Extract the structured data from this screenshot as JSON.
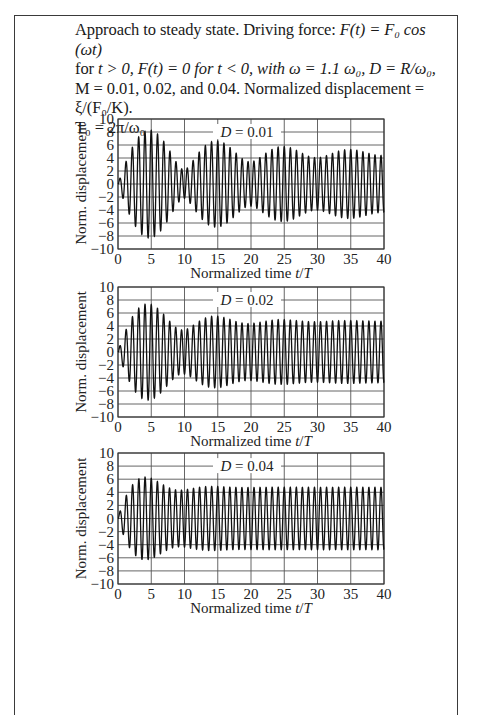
{
  "caption": {
    "line1_a": "Approach to steady state. Driving force: ",
    "line1_eq": "F(t) = F₀ cos (ωt)",
    "line2_a": "for ",
    "line2_eq": "t > 0, F(t) = 0 for t < 0, with ω = 1.1 ω₀, D = R/ω₀,",
    "line3": "M = 0.01, 0.02, and 0.04. Normalized displacement = ξ/(F₀/K).",
    "line4": "T₀ = 2π/ω₀"
  },
  "chart_data": [
    {
      "type": "line",
      "title": "D = 0.01",
      "xlabel": "Normalized time t/T",
      "ylabel": "Norm. displacement",
      "xlim": [
        0,
        40
      ],
      "ylim": [
        -10,
        10
      ],
      "xticks": [
        0,
        5,
        10,
        15,
        20,
        25,
        30,
        35,
        40
      ],
      "yticks": [
        -10,
        -8,
        -6,
        -4,
        -2,
        0,
        2,
        4,
        6,
        8,
        10
      ],
      "grid": true,
      "model": {
        "omega_ratio": 1.1,
        "damping": 0.01
      },
      "envelope_peaks": [
        {
          "t": 5,
          "y": -9.8
        },
        {
          "t": 10,
          "y": 2.0
        },
        {
          "t": 15,
          "y": 8.0
        },
        {
          "t": 20,
          "y": 2.5
        },
        {
          "t": 25,
          "y": -8.0
        },
        {
          "t": 30,
          "y": 3.0
        },
        {
          "t": 35,
          "y": 6.3
        },
        {
          "t": 40,
          "y": 3.5
        }
      ]
    },
    {
      "type": "line",
      "title": "D = 0.02",
      "xlabel": "Normalized time t/T",
      "ylabel": "Norm. displacement",
      "xlim": [
        0,
        40
      ],
      "ylim": [
        -10,
        10
      ],
      "xticks": [
        0,
        5,
        10,
        15,
        20,
        25,
        30,
        35,
        40
      ],
      "yticks": [
        -10,
        -8,
        -6,
        -4,
        -2,
        0,
        2,
        4,
        6,
        8,
        10
      ],
      "grid": true,
      "model": {
        "omega_ratio": 1.1,
        "damping": 0.02
      },
      "envelope_peaks": [
        {
          "t": 5,
          "y": -9.8
        },
        {
          "t": 10,
          "y": 2.5
        },
        {
          "t": 15,
          "y": -9.8
        },
        {
          "t": 20,
          "y": 3.5
        },
        {
          "t": 25,
          "y": 5.8
        },
        {
          "t": 30,
          "y": 4.0
        },
        {
          "t": 35,
          "y": 5.3
        },
        {
          "t": 40,
          "y": 4.2
        }
      ]
    },
    {
      "type": "line",
      "title": "D = 0.04",
      "xlabel": "Normalized time t/T",
      "ylabel": "Norm. displacement",
      "xlim": [
        0,
        40
      ],
      "ylim": [
        -10,
        10
      ],
      "xticks": [
        0,
        5,
        10,
        15,
        20,
        25,
        30,
        35,
        40
      ],
      "yticks": [
        -10,
        -8,
        -6,
        -4,
        -2,
        0,
        2,
        4,
        6,
        8,
        10
      ],
      "grid": true,
      "model": {
        "omega_ratio": 1.1,
        "damping": 0.04
      },
      "envelope_peaks": [
        {
          "t": 5,
          "y": -8.0
        },
        {
          "t": 10,
          "y": 3.5
        },
        {
          "t": 15,
          "y": 5.5
        },
        {
          "t": 20,
          "y": 4.4
        },
        {
          "t": 25,
          "y": 4.8
        },
        {
          "t": 30,
          "y": 4.5
        },
        {
          "t": 35,
          "y": 4.8
        },
        {
          "t": 40,
          "y": 6.3
        }
      ]
    }
  ],
  "layout": {
    "plots": [
      {
        "x0": 118,
        "x1": 384,
        "y0": 119,
        "y1": 249
      },
      {
        "x0": 118,
        "x1": 384,
        "y0": 287,
        "y1": 417
      },
      {
        "x0": 118,
        "x1": 384,
        "y0": 453,
        "y1": 584
      }
    ]
  }
}
